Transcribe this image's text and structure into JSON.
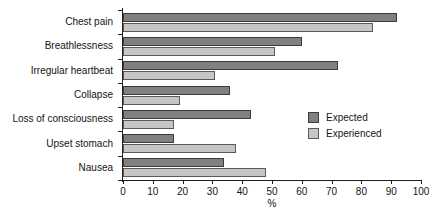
{
  "chart_data": {
    "type": "bar",
    "orientation": "horizontal",
    "title": "",
    "xlabel": "%",
    "ylabel": "",
    "xlim": [
      0,
      100
    ],
    "xticks": [
      0,
      10,
      20,
      30,
      40,
      50,
      60,
      70,
      80,
      90,
      100
    ],
    "grid": false,
    "legend_position": "center-right",
    "categories": [
      "Chest pain",
      "Breathlessness",
      "Irregular heartbeat",
      "Collapse",
      "Loss of consciousness",
      "Upset stomach",
      "Nausea"
    ],
    "series": [
      {
        "name": "Expected",
        "color": "#808080",
        "values": [
          92,
          60,
          72,
          36,
          43,
          17,
          34
        ]
      },
      {
        "name": "Experienced",
        "color": "#c6c6c6",
        "values": [
          84,
          51,
          31,
          19,
          17,
          38,
          48
        ]
      }
    ]
  },
  "legend": {
    "entries": [
      {
        "label": "Expected"
      },
      {
        "label": "Experienced"
      }
    ]
  },
  "colors": {
    "expected": "#808080",
    "experienced": "#c6c6c6",
    "axis": "#202020",
    "text": "#141414",
    "background": "#ffffff"
  }
}
